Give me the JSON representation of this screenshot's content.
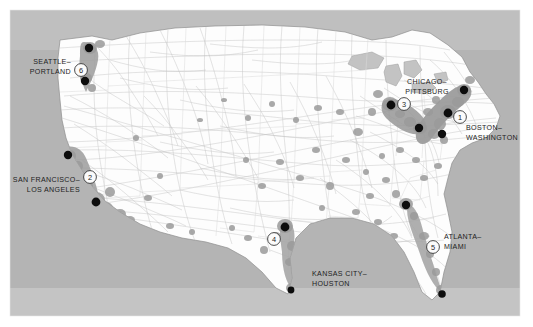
{
  "figure": {
    "type": "map",
    "title": "",
    "frame": {
      "x": 10,
      "y": 10,
      "width": 510,
      "height": 306
    }
  },
  "colors": {
    "ocean": "#b4b4b4",
    "land": "#fdfdfd",
    "urban_area": "#9a9a9a",
    "corridor_band": "#a9a9a9",
    "network_line": "#c3c3c3",
    "state_border": "#d2d2d2",
    "coastline": "#8e8e8e",
    "city_dot": "#0d0d0d",
    "label_text": "#1d1d1d",
    "badge_fill": "#fbfbfb",
    "badge_stroke": "#2a2a2a",
    "page_background": "#ffffff"
  },
  "legend": {
    "badge_shape": "numbered-circle",
    "note": ""
  },
  "corridors": [
    {
      "id": 1,
      "number": "1",
      "name": "BOSTON–WASHINGTON",
      "lines": [
        "BOSTON–",
        "WASHINGTON"
      ],
      "label_x": 466,
      "label_y": 127,
      "label_anchor": "start",
      "badge_x": 460,
      "badge_y": 117,
      "region": "northeast"
    },
    {
      "id": 2,
      "number": "2",
      "name": "SAN FRANCISCO–LOS ANGELES",
      "lines": [
        "SAN FRANCISCO–",
        "LOS ANGELES"
      ],
      "label_x": 78,
      "label_y": 182,
      "label_anchor": "end",
      "badge_x": 90,
      "badge_y": 177,
      "region": "west-coast"
    },
    {
      "id": 3,
      "number": "3",
      "name": "CHICAGO–PITTSBURG",
      "lines": [
        "CHICAGO–",
        "PITTSBURG"
      ],
      "label_x": 427,
      "label_y": 85,
      "label_anchor": "middle",
      "badge_x": 404,
      "badge_y": 104,
      "region": "midwest"
    },
    {
      "id": 4,
      "number": "4",
      "name": "KANSAS CITY–HOUSTON",
      "lines": [
        "KANSAS CITY–",
        "HOUSTON"
      ],
      "label_x": 312,
      "label_y": 277,
      "label_anchor": "start",
      "badge_x": 274,
      "badge_y": 239,
      "region": "central"
    },
    {
      "id": 5,
      "number": "5",
      "name": "ATLANTA–MIAMI",
      "lines": [
        "ATLANTA–",
        "MIAMI"
      ],
      "label_x": 444,
      "label_y": 238,
      "label_anchor": "start",
      "badge_x": 433,
      "badge_y": 247,
      "region": "southeast"
    },
    {
      "id": 6,
      "number": "6",
      "name": "SEATTLE–PORTLAND",
      "lines": [
        "SEATTLE–",
        "PORTLAND"
      ],
      "label_x": 70,
      "label_y": 65,
      "label_anchor": "end",
      "badge_x": 81,
      "badge_y": 70,
      "region": "pacific-northwest"
    }
  ],
  "cities": [
    {
      "name": "seattle",
      "x": 89,
      "y": 48
    },
    {
      "name": "portland",
      "x": 85,
      "y": 81
    },
    {
      "name": "san-francisco",
      "x": 68,
      "y": 155
    },
    {
      "name": "los-angeles",
      "x": 96,
      "y": 202
    },
    {
      "name": "kansas-city",
      "x": 285,
      "y": 227
    },
    {
      "name": "houston",
      "x": 291,
      "y": 290
    },
    {
      "name": "chicago",
      "x": 391,
      "y": 105
    },
    {
      "name": "pittsburg",
      "x": 419,
      "y": 128
    },
    {
      "name": "washington",
      "x": 442,
      "y": 134
    },
    {
      "name": "new-york",
      "x": 448,
      "y": 113
    },
    {
      "name": "boston",
      "x": 464,
      "y": 90
    },
    {
      "name": "atlanta",
      "x": 406,
      "y": 205
    },
    {
      "name": "miami",
      "x": 442,
      "y": 294
    }
  ]
}
